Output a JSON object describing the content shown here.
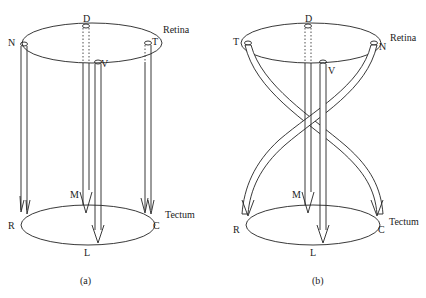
{
  "figure": {
    "panels": [
      {
        "id": "a",
        "caption": "(a)",
        "retina_label": "Retina",
        "tectum_label": "Tectum",
        "retina_points": {
          "top": "D",
          "left": "N",
          "right": "T",
          "bottom": "V"
        },
        "tectum_points": {
          "left": "R",
          "right": "C",
          "top": "M",
          "bottom": "L"
        },
        "mapping": [
          {
            "from": "N",
            "to": "R"
          },
          {
            "from": "T",
            "to": "C"
          },
          {
            "from": "D",
            "to": "M"
          },
          {
            "from": "V",
            "to": "L"
          }
        ],
        "crossed": false
      },
      {
        "id": "b",
        "caption": "(b)",
        "retina_label": "Retina",
        "tectum_label": "Tectum",
        "retina_points": {
          "top": "D",
          "left": "T",
          "right": "N",
          "bottom": "V"
        },
        "tectum_points": {
          "left": "R",
          "right": "C",
          "top": "M",
          "bottom": "L"
        },
        "mapping": [
          {
            "from": "T",
            "to": "C"
          },
          {
            "from": "N",
            "to": "R"
          },
          {
            "from": "D",
            "to": "M"
          },
          {
            "from": "V",
            "to": "L"
          }
        ],
        "crossed": true
      }
    ]
  }
}
